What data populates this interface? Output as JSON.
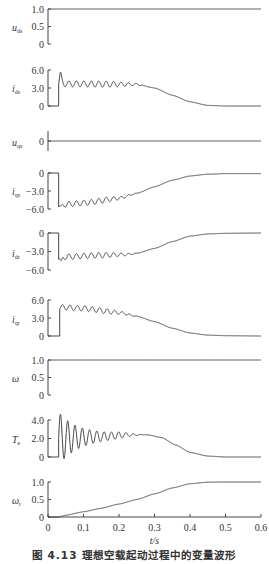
{
  "chart_data": {
    "type": "line",
    "title": "图 4.13 理想空载起动过程中的变量波形",
    "xlabel": "t/s",
    "xlim": [
      0,
      0.6
    ],
    "xticks": [
      0,
      0.1,
      0.2,
      0.3,
      0.4,
      0.5,
      0.6
    ],
    "xtick_labels": [
      "0",
      "0.1",
      "0.2",
      "0.3",
      "0.4",
      "0.5",
      "0.6"
    ],
    "grid": false,
    "layout": {
      "x0_px": 48,
      "x1_px": 261,
      "axis_bottom_px": 517,
      "xtick_label_y": 531,
      "xlabel_y": 544,
      "caption_y": 559
    },
    "series": [
      {
        "name": "u_ds",
        "symbol": "u",
        "subscript": "ds",
        "yticks": [
          0,
          0.5,
          1.0
        ],
        "ytick_labels": [
          "0",
          "0.5",
          "1.0"
        ],
        "ylim": [
          0,
          1.0
        ],
        "py_top": 9,
        "py_bottom": 44,
        "label_y": 28,
        "step_t": 0.0,
        "envelope": [
          [
            0,
            1.0
          ],
          [
            0.6,
            1.0
          ]
        ],
        "pre_value": 1.0,
        "osc": null
      },
      {
        "name": "i_ds",
        "symbol": "i",
        "subscript": "ds",
        "yticks": [
          0,
          3.0,
          6.0
        ],
        "ytick_labels": [
          "0",
          "3.0",
          "6.0"
        ],
        "ylim": [
          0,
          6.0
        ],
        "py_top": 70,
        "py_bottom": 106,
        "label_y": 89,
        "step_t": 0.03,
        "pre_value": 0,
        "spike": {
          "t": 0.035,
          "value": 5.3
        },
        "envelope": [
          [
            0.03,
            3.7
          ],
          [
            0.25,
            3.6
          ],
          [
            0.3,
            3.0
          ],
          [
            0.35,
            1.8
          ],
          [
            0.4,
            0.7
          ],
          [
            0.45,
            0.1
          ],
          [
            0.5,
            0.0
          ],
          [
            0.6,
            0.0
          ]
        ],
        "osc": {
          "amp": 0.5,
          "period": 0.021,
          "decay_start": 0.18,
          "decay_end": 0.28
        }
      },
      {
        "name": "u_qs",
        "symbol": "u",
        "subscript": "qs",
        "yticks": [
          0
        ],
        "ytick_labels": [
          "0"
        ],
        "ylim": [
          -1,
          1
        ],
        "py_top": 130,
        "py_bottom": 152,
        "label_y": 143,
        "step_t": 0.0,
        "pre_value": 0,
        "envelope": [
          [
            0,
            0
          ],
          [
            0.6,
            0
          ]
        ],
        "osc": null
      },
      {
        "name": "i_qs",
        "symbol": "i",
        "subscript": "qs",
        "yticks": [
          -6.0,
          -3.0,
          0
        ],
        "ytick_labels": [
          "−6.0",
          "−3.0",
          "0"
        ],
        "ylim": [
          -6.0,
          0
        ],
        "py_top": 173,
        "py_bottom": 209,
        "label_y": 192,
        "step_t": 0.03,
        "pre_value": 0,
        "spike": {
          "t": 0.037,
          "value": -5.9
        },
        "envelope": [
          [
            0.035,
            -5.3
          ],
          [
            0.1,
            -5.0
          ],
          [
            0.2,
            -4.2
          ],
          [
            0.25,
            -3.4
          ],
          [
            0.3,
            -2.3
          ],
          [
            0.35,
            -1.2
          ],
          [
            0.4,
            -0.5
          ],
          [
            0.45,
            -0.2
          ],
          [
            0.5,
            -0.1
          ],
          [
            0.6,
            -0.1
          ]
        ],
        "osc": {
          "amp": 0.45,
          "period": 0.021,
          "decay_start": 0.16,
          "decay_end": 0.26
        }
      },
      {
        "name": "i_dr",
        "symbol": "i",
        "subscript": "dr",
        "yticks": [
          -6.0,
          -3.0,
          0
        ],
        "ytick_labels": [
          "−6.0",
          "−3.0",
          "0"
        ],
        "ylim": [
          -6.0,
          0
        ],
        "py_top": 233,
        "py_bottom": 270,
        "label_y": 254,
        "step_t": 0.03,
        "pre_value": 0,
        "spike": {
          "t": 0.037,
          "value": -4.9
        },
        "envelope": [
          [
            0.035,
            -3.9
          ],
          [
            0.15,
            -3.6
          ],
          [
            0.22,
            -3.5
          ],
          [
            0.25,
            -3.3
          ],
          [
            0.3,
            -2.5
          ],
          [
            0.35,
            -1.4
          ],
          [
            0.4,
            -0.5
          ],
          [
            0.45,
            -0.15
          ],
          [
            0.5,
            -0.05
          ],
          [
            0.6,
            0
          ]
        ],
        "osc": {
          "amp": 0.45,
          "period": 0.021,
          "decay_start": 0.16,
          "decay_end": 0.26
        }
      },
      {
        "name": "i_qr",
        "symbol": "i",
        "subscript": "qr",
        "yticks": [
          0,
          3.0,
          6.0
        ],
        "ytick_labels": [
          "0",
          "3.0",
          "6.0"
        ],
        "ylim": [
          0,
          6.0
        ],
        "py_top": 300,
        "py_bottom": 336,
        "label_y": 320,
        "step_t": 0.033,
        "pre_value": 0,
        "spike": null,
        "envelope": [
          [
            0.035,
            4.8
          ],
          [
            0.1,
            4.6
          ],
          [
            0.2,
            3.9
          ],
          [
            0.25,
            3.3
          ],
          [
            0.3,
            2.4
          ],
          [
            0.35,
            1.3
          ],
          [
            0.4,
            0.5
          ],
          [
            0.45,
            0.15
          ],
          [
            0.5,
            0.05
          ],
          [
            0.6,
            0.0
          ]
        ],
        "osc": {
          "amp": 0.45,
          "period": 0.021,
          "decay_start": 0.16,
          "decay_end": 0.26
        }
      },
      {
        "name": "ω",
        "symbol": "ω",
        "subscript": "",
        "yticks": [
          0,
          0.5,
          1.0
        ],
        "ytick_labels": [
          "0",
          "0.5",
          "1.0"
        ],
        "ylim": [
          0,
          1.0
        ],
        "py_top": 360,
        "py_bottom": 395,
        "label_y": 379,
        "step_t": 0.0,
        "pre_value": 1.0,
        "envelope": [
          [
            0,
            1.0
          ],
          [
            0.6,
            1.0
          ]
        ],
        "osc": null
      },
      {
        "name": "T_e",
        "symbol": "T",
        "subscript": "e",
        "yticks": [
          0,
          2.0,
          4.0
        ],
        "ytick_labels": [
          "0",
          "2.0",
          "4.0"
        ],
        "ylim": [
          0,
          4.0
        ],
        "py_top": 420,
        "py_bottom": 457,
        "label_y": 440,
        "step_t": 0.03,
        "pre_value": 0,
        "spike": null,
        "envelope": [
          [
            0.03,
            2.0
          ],
          [
            0.15,
            2.2
          ],
          [
            0.22,
            2.4
          ],
          [
            0.28,
            2.4
          ],
          [
            0.32,
            2.1
          ],
          [
            0.36,
            1.3
          ],
          [
            0.4,
            0.5
          ],
          [
            0.45,
            0.1
          ],
          [
            0.5,
            0.0
          ],
          [
            0.6,
            0.0
          ]
        ],
        "osc": {
          "amp": 2.6,
          "period": 0.0205,
          "decay_tau": 0.055,
          "phase": "sin",
          "decay_start": 0.2,
          "decay_end": 0.27
        }
      },
      {
        "name": "ω_r",
        "symbol": "ω",
        "subscript": "r",
        "yticks": [
          0,
          0.5,
          1.0
        ],
        "ytick_labels": [
          "0",
          "0.5",
          "1.0"
        ],
        "ylim": [
          0,
          1.0
        ],
        "py_top": 482,
        "py_bottom": 517,
        "label_y": 501,
        "step_t": 0.03,
        "pre_value": 0,
        "spike": null,
        "envelope": [
          [
            0.03,
            0.0
          ],
          [
            0.05,
            0.05
          ],
          [
            0.1,
            0.15
          ],
          [
            0.15,
            0.25
          ],
          [
            0.2,
            0.37
          ],
          [
            0.25,
            0.5
          ],
          [
            0.3,
            0.66
          ],
          [
            0.35,
            0.83
          ],
          [
            0.4,
            0.95
          ],
          [
            0.45,
            0.995
          ],
          [
            0.5,
            1.0
          ],
          [
            0.6,
            1.0
          ]
        ],
        "osc": null
      }
    ]
  }
}
